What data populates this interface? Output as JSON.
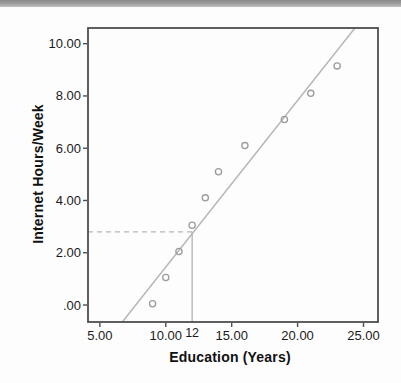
{
  "window": {
    "top_bar_color_top": "#898989",
    "top_bar_color_bottom": "#c2c2c2",
    "background": "#fdfdfd"
  },
  "chart_data": {
    "type": "scatter",
    "title": "",
    "xlabel": "Education (Years)",
    "ylabel": "Internet Hours/Week",
    "xlim": [
      4.1,
      26.1
    ],
    "ylim": [
      -0.65,
      10.6
    ],
    "grid": false,
    "legend": null,
    "x_ticks": [
      {
        "value": 5,
        "label": "5.00"
      },
      {
        "value": 10,
        "label": "10.00"
      },
      {
        "value": 15,
        "label": "15.00"
      },
      {
        "value": 20,
        "label": "20.00"
      },
      {
        "value": 25,
        "label": "25.00"
      }
    ],
    "y_ticks": [
      {
        "value": 0,
        "label": ".00"
      },
      {
        "value": 2,
        "label": "2.00"
      },
      {
        "value": 4,
        "label": "4.00"
      },
      {
        "value": 6,
        "label": "6.00"
      },
      {
        "value": 8,
        "label": "8.00"
      },
      {
        "value": 10,
        "label": "10.00"
      }
    ],
    "series": [
      {
        "name": "observations",
        "points": [
          {
            "x": 9,
            "y": 0.05
          },
          {
            "x": 10,
            "y": 1.05
          },
          {
            "x": 11,
            "y": 2.05
          },
          {
            "x": 12,
            "y": 3.05
          },
          {
            "x": 13,
            "y": 4.1
          },
          {
            "x": 14,
            "y": 5.1
          },
          {
            "x": 16,
            "y": 6.1
          },
          {
            "x": 19,
            "y": 7.1
          },
          {
            "x": 21,
            "y": 8.1
          },
          {
            "x": 23,
            "y": 9.15
          }
        ]
      }
    ],
    "trend_line": {
      "x1": 6.7,
      "y1": -0.65,
      "x2": 24.35,
      "y2": 10.6
    },
    "prediction_annotation": {
      "x": 12,
      "x_label": "12",
      "predicted_y": 2.8
    },
    "colors": {
      "frame": "#4e4e4e",
      "tick_text": "#1b1b1b",
      "axis_title_text": "#111111",
      "trend_line": "#b5b5b5",
      "point_stroke": "#9c9c9c",
      "dashed_line": "#b5b5b5",
      "vertical_line": "#ababab"
    }
  }
}
